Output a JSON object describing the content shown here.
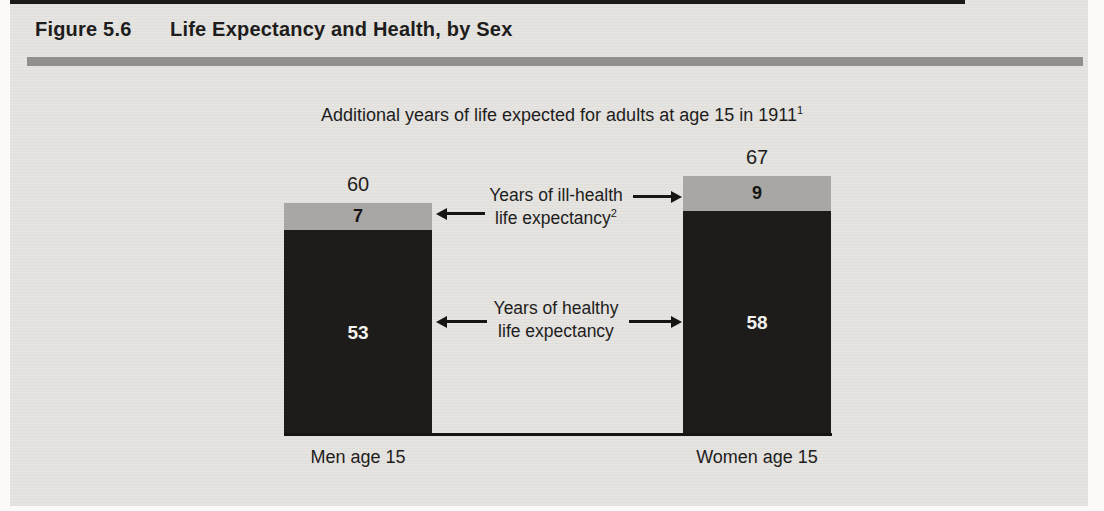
{
  "figure": {
    "label": "Figure 5.6",
    "title": "Life Expectancy and Health, by Sex"
  },
  "chart_data": {
    "type": "bar",
    "stacked": true,
    "title": "Additional years of life expected for adults at age 15 in 1911",
    "title_footnote_marker": "1",
    "categories": [
      "Men age 15",
      "Women age 15"
    ],
    "series": [
      {
        "name": "Years of healthy life expectancy",
        "values": [
          53,
          58
        ],
        "color": "#1d1c1b"
      },
      {
        "name": "Years of ill-health life expectancy",
        "values": [
          7,
          9
        ],
        "color": "#a8a7a4",
        "footnote_marker": "2"
      }
    ],
    "totals": [
      60,
      67
    ],
    "unit": "years",
    "axes": "none (no gridlines, no y-axis; values labeled on bars)",
    "annotations": [
      {
        "lines": [
          "Years of ill-health",
          "life expectancy"
        ],
        "footnote_marker": "2",
        "points_to": "ill-health segments of both bars"
      },
      {
        "lines": [
          "Years of healthy",
          "life expectancy"
        ],
        "points_to": "healthy segments of both bars"
      }
    ]
  },
  "colors": {
    "figure_background": "#e5e4e1",
    "page_margin": "#fbfaf8",
    "top_rule": "#1b1a19",
    "header_rule": "#908f8c",
    "bar_healthy": "#1d1c1b",
    "bar_ill_health": "#a8a7a4",
    "text": "#1e1d1c",
    "bar_value_text_on_dark": "#f2f1ee"
  }
}
